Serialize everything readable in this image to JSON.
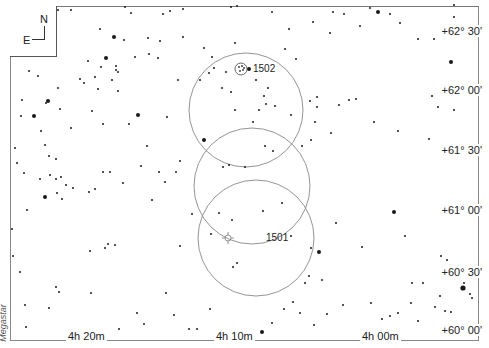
{
  "map": {
    "type": "star-chart",
    "compass": {
      "north": "N",
      "east": "E"
    },
    "dec_labels": [
      {
        "text": "+62° 30'",
        "y": 31
      },
      {
        "text": "+62° 00'",
        "y": 90
      },
      {
        "text": "+61° 30'",
        "y": 150
      },
      {
        "text": "+61° 00'",
        "y": 210
      },
      {
        "text": "+60° 30'",
        "y": 272
      },
      {
        "text": "+60° 00'",
        "y": 330
      }
    ],
    "ra_labels": [
      {
        "text": "4h 20m",
        "x": 68
      },
      {
        "text": "4h 10m",
        "x": 216
      },
      {
        "text": "4h 00m",
        "x": 362
      }
    ],
    "watermark": "Megastar",
    "objects": [
      {
        "id": "1502",
        "label": "1502",
        "symbol": "planetary-nebula",
        "x": 241,
        "y": 69
      },
      {
        "id": "1501",
        "label": "1501",
        "symbol": "open-cluster",
        "x": 256,
        "y": 238
      }
    ],
    "fov_circles": [
      {
        "cx": 246,
        "cy": 110,
        "r": 57
      },
      {
        "cx": 252,
        "cy": 186,
        "r": 58
      },
      {
        "cx": 256,
        "cy": 238,
        "r": 58
      }
    ],
    "line_color": "#888888",
    "star_color": "#1a1a1a"
  }
}
